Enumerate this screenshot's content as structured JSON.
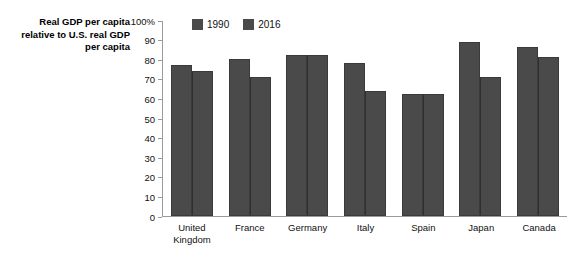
{
  "chart_data": {
    "type": "bar",
    "title": "",
    "xlabel": "",
    "ylabel": "Real GDP per capita relative to U.S. real GDP per capita",
    "ylabel_lines": [
      "Real GDP per capita",
      "relative to U.S. real GDP",
      "per capita"
    ],
    "categories": [
      "United Kingdom",
      "France",
      "Germany",
      "Italy",
      "Spain",
      "Japan",
      "Canada"
    ],
    "category_lines": [
      [
        "United",
        "Kingdom"
      ],
      [
        "France"
      ],
      [
        "Germany"
      ],
      [
        "Italy"
      ],
      [
        "Spain"
      ],
      [
        "Japan"
      ],
      [
        "Canada"
      ]
    ],
    "series": [
      {
        "name": "1990",
        "color": "#4a4a4a",
        "values": [
          77,
          80,
          82,
          78,
          62,
          89,
          86
        ]
      },
      {
        "name": "2016",
        "color": "#4a4a4a",
        "values": [
          74,
          71,
          82,
          64,
          62,
          71,
          81
        ]
      }
    ],
    "ylim": [
      0,
      100
    ],
    "ytick_values": [
      100,
      90,
      80,
      70,
      60,
      50,
      40,
      30,
      20,
      10,
      0
    ],
    "ytick_labels": [
      "100%",
      "90",
      "80",
      "70",
      "60",
      "50",
      "40",
      "30",
      "20",
      "10",
      "0"
    ],
    "grid": false,
    "legend_position": "top-left",
    "bar_color": "#4a4a4a",
    "axis_color": "#9a9a9a"
  }
}
